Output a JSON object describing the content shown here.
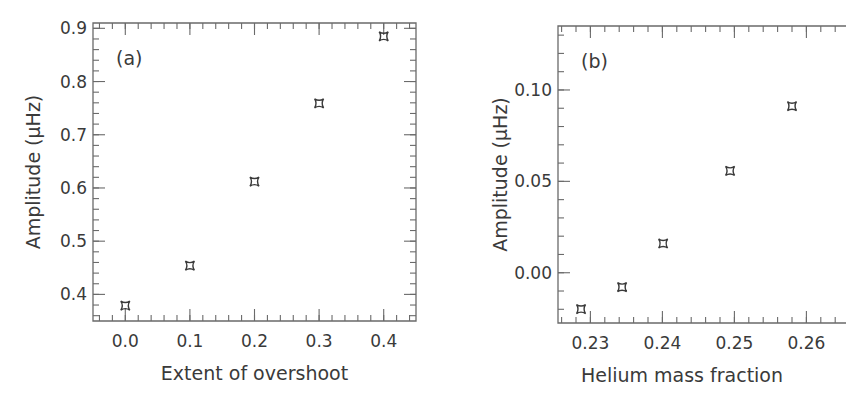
{
  "chart_data": [
    {
      "type": "scatter",
      "panel_label": "(a)",
      "title": "",
      "xlabel": "Extent of overshoot",
      "ylabel": "Amplitude (μHz)",
      "xlim": [
        -0.05,
        0.45
      ],
      "ylim": [
        0.35,
        0.91
      ],
      "xticks": [
        0.0,
        0.1,
        0.2,
        0.3,
        0.4
      ],
      "xtick_labels": [
        "0.0",
        "0.1",
        "0.2",
        "0.3",
        "0.4"
      ],
      "yticks": [
        0.4,
        0.5,
        0.6,
        0.7,
        0.8,
        0.9
      ],
      "ytick_labels": [
        "0.4",
        "0.5",
        "0.6",
        "0.7",
        "0.8",
        "0.9"
      ],
      "grid": false,
      "legend": null,
      "marker": "four-point-star",
      "x": [
        0.0,
        0.1,
        0.2,
        0.3,
        0.4
      ],
      "y": [
        0.379,
        0.454,
        0.612,
        0.759,
        0.885
      ]
    },
    {
      "type": "scatter",
      "panel_label": "(b)",
      "title": "",
      "xlabel": "Helium mass fraction",
      "ylabel": "Amplitude (μHz)",
      "xlim": [
        0.2255,
        0.2655
      ],
      "ylim": [
        -0.0275,
        0.135
      ],
      "xticks": [
        0.23,
        0.24,
        0.25,
        0.26
      ],
      "xtick_labels": [
        "0.23",
        "0.24",
        "0.25",
        "0.26"
      ],
      "yticks": [
        0.0,
        0.05,
        0.1
      ],
      "ytick_labels": [
        "0.00",
        "0.05",
        "0.10"
      ],
      "grid": false,
      "legend": null,
      "marker": "four-point-star",
      "x": [
        0.2287,
        0.2344,
        0.2401,
        0.2494,
        0.258
      ],
      "y": [
        -0.0199,
        -0.0079,
        0.016,
        0.0557,
        0.0911
      ]
    }
  ],
  "layout": {
    "panels": [
      {
        "left": 93,
        "top": 23,
        "right": 416,
        "bottom": 321,
        "right_border": true,
        "x_minor": 0.02,
        "y_minor": 0.02,
        "ylabel_x": 40,
        "xlabel_y": 380
      },
      {
        "left": 558,
        "top": 26,
        "right": 846,
        "bottom": 323,
        "right_border": false,
        "x_minor": 0.002,
        "y_minor": 0.01,
        "ylabel_x": 507,
        "xlabel_y": 382
      }
    ]
  }
}
